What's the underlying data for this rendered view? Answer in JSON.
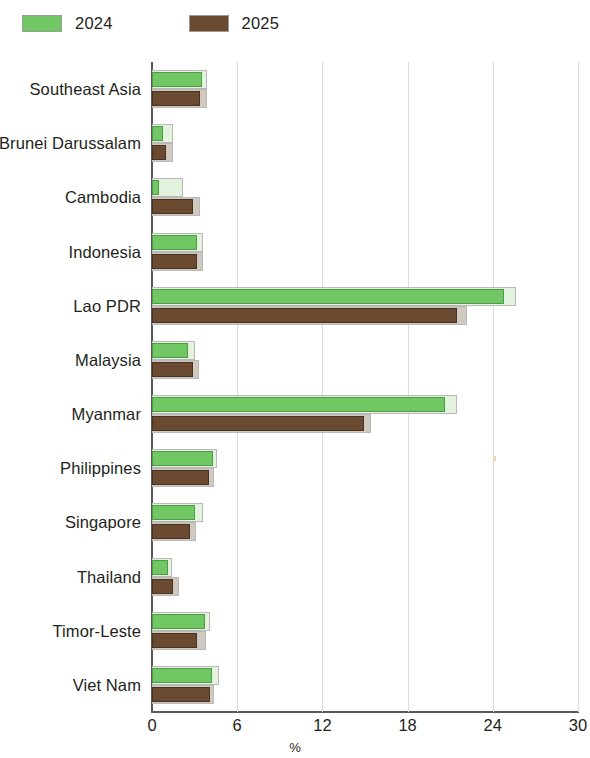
{
  "legend": {
    "items": [
      {
        "label": "2024",
        "color": "#72c765",
        "key": "2024"
      },
      {
        "label": "2025",
        "color": "#6b4a32",
        "key": "2025"
      }
    ]
  },
  "axis": {
    "x_ticks": [
      "0",
      "6",
      "12",
      "18",
      "24",
      "30"
    ],
    "x_label": "%"
  },
  "chart_data": {
    "type": "bar",
    "orientation": "horizontal",
    "title": "",
    "subtitle": "",
    "xlabel": "%",
    "ylabel": "",
    "xlim": [
      0,
      30
    ],
    "xticks": [
      0,
      6,
      12,
      18,
      24,
      30
    ],
    "grid": true,
    "legend_position": "top-left",
    "categories": [
      "Southeast Asia",
      "Brunei Darussalam",
      "Cambodia",
      "Indonesia",
      "Lao PDR",
      "Malaysia",
      "Myanmar",
      "Philippines",
      "Singapore",
      "Thailand",
      "Timor-Leste",
      "Viet Nam"
    ],
    "series": [
      {
        "name": "2024",
        "color": "#72c765",
        "values": [
          3.5,
          0.8,
          0.5,
          3.2,
          24.8,
          2.5,
          20.6,
          4.3,
          3.0,
          1.1,
          3.7,
          4.2
        ]
      },
      {
        "name": "2025",
        "color": "#6b4a32",
        "values": [
          3.4,
          1.0,
          2.9,
          3.2,
          21.5,
          2.9,
          14.9,
          4.0,
          2.7,
          1.5,
          3.2,
          4.1
        ]
      }
    ],
    "backdrop_series": [
      {
        "name": "2024-backdrop",
        "color": "#e4f3dd",
        "values": [
          3.9,
          1.5,
          2.2,
          3.6,
          25.6,
          3.0,
          21.5,
          4.6,
          3.6,
          1.4,
          4.1,
          4.7
        ]
      },
      {
        "name": "2025-backdrop",
        "color": "#cfc9c0",
        "values": [
          3.9,
          1.5,
          3.4,
          3.6,
          22.2,
          3.3,
          15.4,
          4.4,
          3.1,
          1.9,
          3.8,
          4.4
        ]
      }
    ]
  }
}
